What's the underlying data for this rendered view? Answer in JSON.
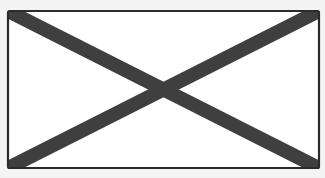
{
  "placeholder": {
    "kind": "image-placeholder",
    "icon": "cross-box-icon",
    "colors": {
      "background": "#f4f4f4",
      "box_fill": "#ffffff",
      "border": "#2b2b2b",
      "cross": "#3f3f3f"
    }
  }
}
